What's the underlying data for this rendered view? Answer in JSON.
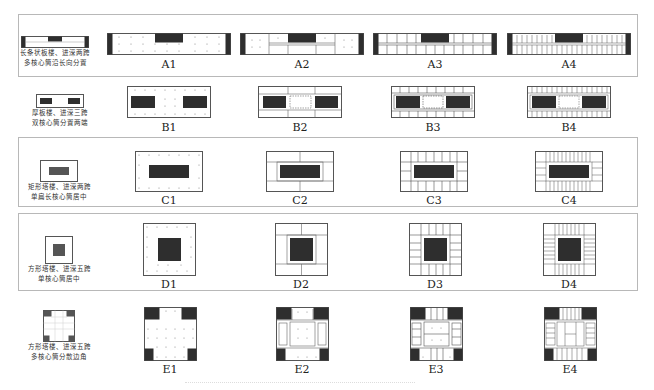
{
  "figure": {
    "rows": [
      {
        "id": "A",
        "caption_line1": "长条状板楼、进深两跨",
        "caption_line2": "多核心筒沿长向分置",
        "variants": [
          {
            "label": "A1",
            "structure": "flat slab, column grid, central core, end cores"
          },
          {
            "label": "A2",
            "structure": "beam frame, central core, end cores"
          },
          {
            "label": "A3",
            "structure": "primary/secondary beams, central core, end cores"
          },
          {
            "label": "A4",
            "structure": "dense ribbed beams, central core, end cores"
          }
        ]
      },
      {
        "id": "B",
        "caption_line1": "厚板楼、进深三跨",
        "caption_line2": "双核心筒分置两端",
        "variants": [
          {
            "label": "B1"
          },
          {
            "label": "B2"
          },
          {
            "label": "B3"
          },
          {
            "label": "B4"
          }
        ]
      },
      {
        "id": "C",
        "caption_line1": "矩形塔楼、进深两跨",
        "caption_line2": "单扁长核心筒居中",
        "variants": [
          {
            "label": "C1"
          },
          {
            "label": "C2"
          },
          {
            "label": "C3"
          },
          {
            "label": "C4"
          }
        ]
      },
      {
        "id": "D",
        "caption_line1": "方形塔楼、进深五跨",
        "caption_line2": "单核心筒居中",
        "variants": [
          {
            "label": "D1"
          },
          {
            "label": "D2"
          },
          {
            "label": "D3"
          },
          {
            "label": "D4"
          }
        ]
      },
      {
        "id": "E",
        "caption_line1": "方形塔楼、进深五跨",
        "caption_line2": "多核心筒分散边角",
        "variants": [
          {
            "label": "E1"
          },
          {
            "label": "E2"
          },
          {
            "label": "E3"
          },
          {
            "label": "E4"
          }
        ]
      }
    ],
    "colors": {
      "core_fill": "#2e2e2e",
      "outline": "#555555",
      "frame_border": "#b8b8b8",
      "column_dot": "#888888"
    }
  }
}
